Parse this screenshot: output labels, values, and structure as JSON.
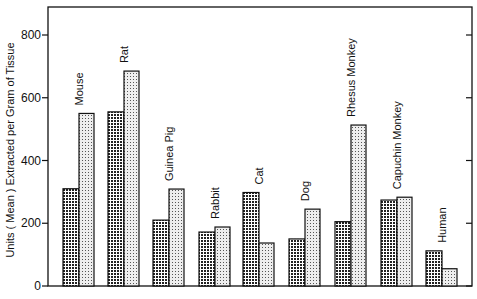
{
  "chart_data": {
    "type": "bar",
    "title": "",
    "xlabel": "",
    "ylabel": "Units (Mean) Extracted per Gram of Tissue",
    "ylim": [
      0,
      900
    ],
    "yticks": [
      0,
      200,
      400,
      600,
      800
    ],
    "grid": false,
    "legend": null,
    "categories": [
      "Mouse",
      "Rat",
      "Guinea Pig",
      "Rabbit",
      "Cat",
      "Dog",
      "Rhesus Monkey",
      "Capuchin Monkey",
      "Human"
    ],
    "series": [
      {
        "name": "Series 1 (dark crosshatch)",
        "pattern": "crosshatch",
        "values": [
          310,
          555,
          210,
          172,
          298,
          150,
          205,
          274,
          112
        ]
      },
      {
        "name": "Series 2 (light stipple)",
        "pattern": "stipple",
        "values": [
          550,
          685,
          309,
          188,
          137,
          245,
          513,
          283,
          55
        ]
      }
    ]
  },
  "labels": {
    "ylabel": "Units ( Mean ) Extracted per Gram of Tissue",
    "ticks": [
      "0",
      "200",
      "400",
      "600",
      "800"
    ],
    "categories": [
      "Mouse",
      "Rat",
      "Guinea Pig",
      "Rabbit",
      "Cat",
      "Dog",
      "Rhesus Monkey",
      "Capuchin Monkey",
      "Human"
    ]
  },
  "colors": {
    "ink": "#111111",
    "dark_fill": "#555555",
    "light_fill": "#cfcfcf"
  }
}
